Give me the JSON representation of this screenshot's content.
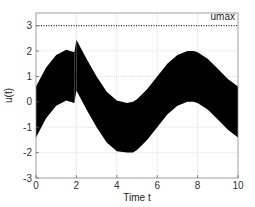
{
  "chart_data": {
    "type": "area",
    "title": "",
    "xlabel": "Time   t",
    "ylabel": "u(t)",
    "xlim": [
      0,
      10
    ],
    "ylim": [
      -3,
      3.5
    ],
    "xticks": [
      0,
      2,
      4,
      6,
      8,
      10
    ],
    "yticks": [
      -3,
      -2,
      -1,
      0,
      1,
      2,
      3
    ],
    "grid": true,
    "legend": null,
    "annotations": [
      {
        "text": "umax",
        "x": 9.6,
        "y": 3.2
      }
    ],
    "reference_line": {
      "name": "umax",
      "y": 3,
      "style": "dotted"
    },
    "series": [
      {
        "name": "u(t) band",
        "description": "Filled black band around sin-shaped trajectory, half-width ~1, discontinuity at t=2",
        "x": [
          0,
          0.5,
          1,
          1.5,
          1.9,
          2.0,
          2.5,
          3,
          3.5,
          4,
          4.5,
          4.8,
          5,
          5.5,
          6,
          6.5,
          7,
          7.5,
          7.8,
          8,
          8.5,
          9,
          9.5,
          10
        ],
        "upper": [
          0.6,
          1.35,
          1.85,
          2.05,
          1.95,
          2.45,
          1.7,
          1.0,
          0.4,
          0.05,
          -0.05,
          0.0,
          0.1,
          0.5,
          1.0,
          1.5,
          1.85,
          2.0,
          2.0,
          1.95,
          1.7,
          1.3,
          0.9,
          0.6
        ],
        "lower": [
          -1.4,
          -0.65,
          -0.15,
          0.05,
          -0.05,
          0.45,
          -0.3,
          -1.0,
          -1.6,
          -1.95,
          -2.0,
          -2.0,
          -1.9,
          -1.5,
          -1.0,
          -0.5,
          -0.15,
          0.0,
          0.0,
          -0.05,
          -0.3,
          -0.7,
          -1.1,
          -1.4
        ]
      }
    ]
  }
}
